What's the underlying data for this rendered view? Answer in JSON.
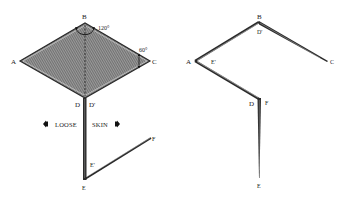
{
  "left_diagram": {
    "points": {
      "A": {
        "label": "A",
        "x": 20,
        "y": 61
      },
      "B": {
        "label": "B",
        "x": 85,
        "y": 23
      },
      "C": {
        "label": "C",
        "x": 150,
        "y": 61
      },
      "D": {
        "label": "D",
        "x": 84,
        "y": 98
      },
      "D_prime": {
        "label": "D'",
        "x": 86,
        "y": 98
      },
      "E": {
        "label": "E",
        "x": 85,
        "y": 180
      },
      "E_prime": {
        "label": "E'",
        "x": 88,
        "y": 162
      },
      "F": {
        "label": "F",
        "x": 150,
        "y": 138
      }
    },
    "angles": {
      "at_B": "120°",
      "at_C": "60°"
    },
    "annotation": {
      "loose_label": "LOOSE",
      "skin_label": "SKIN"
    }
  },
  "right_diagram": {
    "points": {
      "A": {
        "label": "A",
        "x": 195,
        "y": 61
      },
      "B": {
        "label": "B",
        "x": 259,
        "y": 22
      },
      "C": {
        "label": "C",
        "x": 328,
        "y": 61
      },
      "D_prime": {
        "label": "D'",
        "x": 259,
        "y": 35
      },
      "E_prime": {
        "label": "E'",
        "x": 213,
        "y": 62
      },
      "D": {
        "label": "D",
        "x": 256,
        "y": 99
      },
      "F": {
        "label": "F",
        "x": 265,
        "y": 99
      },
      "E": {
        "label": "E",
        "x": 259,
        "y": 178
      }
    }
  },
  "colors": {
    "ink": "#2a2a2a",
    "hatch_fill": "#7a7a7a",
    "background": "#ffffff"
  }
}
